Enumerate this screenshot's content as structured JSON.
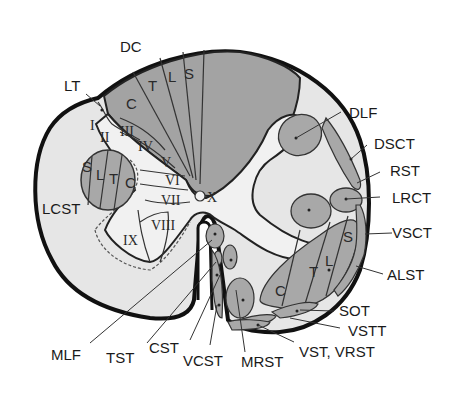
{
  "colors": {
    "background": "#ffffff",
    "white_matter": "#e6e6e6",
    "gray_matter": "#f1f1f1",
    "tract_fill": "#a8a8a8",
    "dorsal_column": "#a3a3a3",
    "outline": "#111111"
  },
  "diagram": {
    "external_labels": {
      "dc": "DC",
      "lt": "LT",
      "lcst": "LCST",
      "dlf": "DLF",
      "dsct": "DSCT",
      "rst": "RST",
      "lrct": "LRCT",
      "vsct": "VSCT",
      "alst": "ALST",
      "sot": "SOT",
      "vstt": "VSTT",
      "vst_vrst": "VST, VRST",
      "mrst": "MRST",
      "vcst": "VCST",
      "cst": "CST",
      "tst": "TST",
      "mlf": "MLF"
    },
    "dorsal_column_segments": [
      "C",
      "T",
      "L",
      "S"
    ],
    "lcst_segments": [
      "S",
      "L",
      "T",
      "C"
    ],
    "alst_segments": [
      "C",
      "T",
      "L",
      "S"
    ],
    "rexed_laminae": [
      "I",
      "II",
      "III",
      "IV",
      "V",
      "VI",
      "VII",
      "VIII",
      "IX",
      "X"
    ]
  }
}
